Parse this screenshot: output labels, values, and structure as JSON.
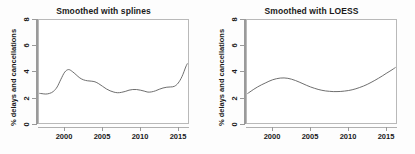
{
  "figure": {
    "background": "#ffffff",
    "curve_color": "#5e5e5e",
    "axis_color": "#9a9a9a"
  },
  "chart_data": [
    {
      "type": "line",
      "title": "Smoothed with splines",
      "xlabel": "",
      "ylabel": "% delays and cancellations",
      "xlim": [
        1996.6,
        2016.3
      ],
      "ylim": [
        0,
        8
      ],
      "xticks": [
        2000,
        2005,
        2010,
        2015
      ],
      "xticklabels": [
        "2000",
        "2005",
        "2010",
        "2015"
      ],
      "yticks": [
        0,
        2,
        4,
        6,
        8
      ],
      "yticklabels": [
        "0",
        "2",
        "4",
        "6",
        "8"
      ],
      "grid": false,
      "legend": "none",
      "series": [
        {
          "name": "Smoothed with splines",
          "x": [
            1996.7,
            1997.0,
            1997.5,
            1998.0,
            1998.5,
            1999.0,
            1999.5,
            2000.0,
            2000.5,
            2001.0,
            2001.5,
            2002.0,
            2002.5,
            2003.0,
            2003.5,
            2004.0,
            2004.5,
            2005.0,
            2005.5,
            2006.0,
            2006.5,
            2007.0,
            2007.5,
            2008.0,
            2008.5,
            2009.0,
            2009.5,
            2010.0,
            2010.5,
            2011.0,
            2011.5,
            2012.0,
            2012.5,
            2013.0,
            2013.5,
            2014.0,
            2014.5,
            2015.0,
            2015.5,
            2016.0,
            2016.2
          ],
          "y": [
            2.3,
            2.28,
            2.25,
            2.3,
            2.45,
            2.8,
            3.4,
            3.95,
            4.15,
            4.0,
            3.75,
            3.5,
            3.35,
            3.28,
            3.25,
            3.2,
            3.05,
            2.85,
            2.65,
            2.5,
            2.4,
            2.35,
            2.38,
            2.45,
            2.55,
            2.6,
            2.6,
            2.55,
            2.48,
            2.4,
            2.42,
            2.5,
            2.62,
            2.72,
            2.78,
            2.8,
            2.85,
            3.1,
            3.6,
            4.35,
            4.6
          ]
        }
      ]
    },
    {
      "type": "line",
      "title": "Smoothed with LOESS",
      "xlabel": "",
      "ylabel": "% delays and cancellations",
      "xlim": [
        1996.6,
        2016.3
      ],
      "ylim": [
        0,
        8
      ],
      "xticks": [
        2000,
        2005,
        2010,
        2015
      ],
      "xticklabels": [
        "2000",
        "2005",
        "2010",
        "2015"
      ],
      "yticks": [
        0,
        2,
        4,
        6,
        8
      ],
      "yticklabels": [
        "0",
        "2",
        "4",
        "6",
        "8"
      ],
      "grid": false,
      "legend": "none",
      "series": [
        {
          "name": "Smoothed with LOESS",
          "x": [
            1996.7,
            1997.0,
            1997.5,
            1998.0,
            1998.5,
            1999.0,
            1999.5,
            2000.0,
            2000.5,
            2001.0,
            2001.5,
            2002.0,
            2002.5,
            2003.0,
            2003.5,
            2004.0,
            2004.5,
            2005.0,
            2005.5,
            2006.0,
            2006.5,
            2007.0,
            2007.5,
            2008.0,
            2008.5,
            2009.0,
            2009.5,
            2010.0,
            2010.5,
            2011.0,
            2011.5,
            2012.0,
            2012.5,
            2013.0,
            2013.5,
            2014.0,
            2014.5,
            2015.0,
            2015.5,
            2016.0,
            2016.2
          ],
          "y": [
            2.3,
            2.42,
            2.62,
            2.8,
            2.96,
            3.1,
            3.24,
            3.36,
            3.44,
            3.49,
            3.5,
            3.47,
            3.4,
            3.3,
            3.18,
            3.05,
            2.92,
            2.8,
            2.7,
            2.61,
            2.54,
            2.49,
            2.46,
            2.44,
            2.44,
            2.45,
            2.48,
            2.52,
            2.58,
            2.66,
            2.76,
            2.87,
            3.0,
            3.15,
            3.31,
            3.48,
            3.66,
            3.85,
            4.03,
            4.22,
            4.3
          ]
        }
      ]
    }
  ]
}
